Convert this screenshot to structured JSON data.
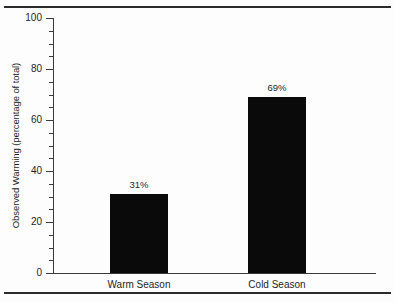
{
  "chart_data": {
    "type": "bar",
    "title": "",
    "xlabel": "",
    "ylabel": "Observed Warming (percentage of total)",
    "categories": [
      "Warm Season",
      "Cold Season"
    ],
    "values": [
      31,
      69
    ],
    "value_labels": [
      "31%",
      "69%"
    ],
    "ylim": [
      0,
      100
    ],
    "y_ticks": [
      0,
      20,
      40,
      60,
      80,
      100
    ],
    "y_tick_labels": [
      "0",
      "20",
      "40",
      "60",
      "80",
      "100"
    ],
    "y_minor_tick_interval": 5,
    "grid": false,
    "legend": false,
    "bar_color": "#0a0a0a",
    "axis_color": "#3a3a3a",
    "background_color": "#fdfdfd"
  },
  "figure": {
    "y_axis_title": "Observed Warming (percentage of total)"
  }
}
